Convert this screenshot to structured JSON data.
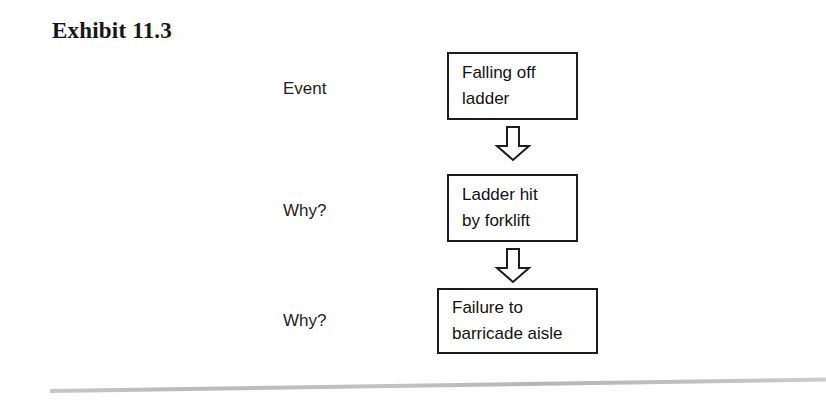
{
  "exhibit": {
    "title": "Exhibit 11.3"
  },
  "diagram": {
    "type": "flowchart",
    "orientation": "vertical",
    "arrow_icon": "down-arrow-icon",
    "stages": [
      {
        "label": "Event",
        "node_text": "Falling off\nladder"
      },
      {
        "label": "Why?",
        "node_text": "Ladder hit\nby forklift"
      },
      {
        "label": "Why?",
        "node_text": "Failure to\nbarricade aisle"
      }
    ]
  },
  "colors": {
    "page_background": "#ffffff",
    "box_border": "#1c1c1c",
    "text": "#121212",
    "footer_rule": "#b4b4b4"
  }
}
